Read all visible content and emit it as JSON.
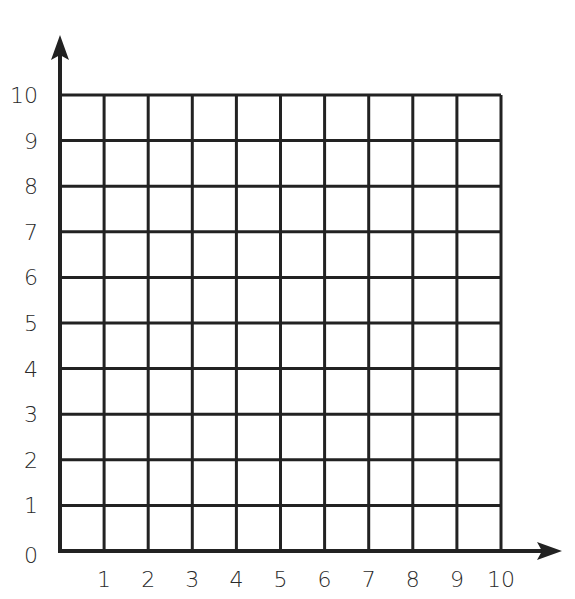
{
  "diagram": {
    "type": "coordinate-grid",
    "x_axis": {
      "min": 0,
      "max": 10,
      "tick_labels": [
        "1",
        "2",
        "3",
        "4",
        "5",
        "6",
        "7",
        "8",
        "9",
        "10"
      ]
    },
    "y_axis": {
      "min": 0,
      "max": 10,
      "tick_labels": [
        "0",
        "1",
        "2",
        "3",
        "4",
        "5",
        "6",
        "7",
        "8",
        "9",
        "10"
      ]
    },
    "origin_label": "0",
    "grid": {
      "columns": 10,
      "rows": 10
    },
    "colors": {
      "line": "#222222",
      "background": "#ffffff",
      "text": "#2a2a2a"
    }
  }
}
